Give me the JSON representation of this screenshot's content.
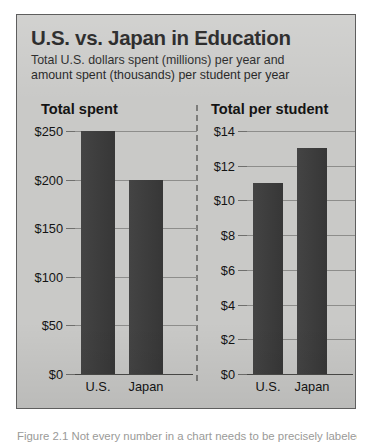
{
  "figure": {
    "title": "U.S. vs. Japan in Education",
    "subtitle_line1": "Total U.S. dollars spent (millions) per year and",
    "subtitle_line2": "amount spent (thousands) per student per year",
    "caption": "Figure 2.1  Not every number in a chart needs to be precisely labeled.",
    "colors": {
      "card_background": "#c9c9c7",
      "card_border": "#5e5e5e",
      "bar_fill": "#3a3a3a",
      "gridline": "#8d8d8b",
      "axis": "#4a4a48",
      "text": "#141414",
      "divider": "#7d7d7b"
    }
  },
  "chart_data": [
    {
      "type": "bar",
      "title": "Total spent",
      "xlabel": "",
      "ylabel": "",
      "categories": [
        "U.S.",
        "Japan"
      ],
      "values": [
        250,
        200
      ],
      "ylim": [
        0,
        250
      ],
      "yticks": [
        0,
        50,
        100,
        150,
        200,
        250
      ],
      "ytick_labels": [
        "$0",
        "$50",
        "$100",
        "$150",
        "$200",
        "$250"
      ],
      "grid": true,
      "legend": "none",
      "units": "millions of U.S. dollars per year"
    },
    {
      "type": "bar",
      "title": "Total per student",
      "xlabel": "",
      "ylabel": "",
      "categories": [
        "U.S.",
        "Japan"
      ],
      "values": [
        11,
        13
      ],
      "ylim": [
        0,
        14
      ],
      "yticks": [
        0,
        2,
        4,
        6,
        8,
        10,
        12,
        14
      ],
      "ytick_labels": [
        "$0",
        "$2",
        "$4",
        "$6",
        "$8",
        "$10",
        "$12",
        "$14"
      ],
      "grid": true,
      "legend": "none",
      "units": "thousands of dollars per student per year"
    }
  ]
}
